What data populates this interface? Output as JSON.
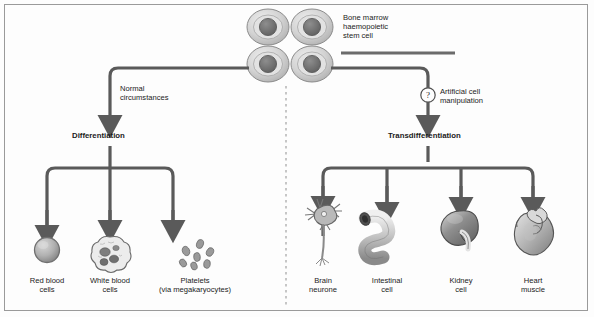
{
  "figure": {
    "source_cell": {
      "label": "Bone marrow\nhaemopoietic\nstem cell",
      "icon": "stem-cell-cluster-icon",
      "count": 4
    },
    "pathways": [
      {
        "id": "normal",
        "condition_label": "Normal\ncircumstances",
        "process_label": "Differentiation",
        "marker_icon": null,
        "outputs": [
          {
            "id": "red-blood-cells",
            "label": "Red blood\ncells",
            "icon": "red-blood-cell-icon"
          },
          {
            "id": "white-blood-cells",
            "label": "White blood\ncells",
            "icon": "white-blood-cell-icon"
          },
          {
            "id": "platelets",
            "label": "Platelets\n(via megakaryocytes)",
            "icon": "platelets-icon"
          }
        ]
      },
      {
        "id": "artificial",
        "condition_label": "Artificial cell\nmanipulation",
        "process_label": "Transdifferentiation",
        "marker_icon": "question-mark-circle-icon",
        "marker_glyph": "?",
        "outputs": [
          {
            "id": "brain-neurone",
            "label": "Brain\nneurone",
            "icon": "neurone-icon"
          },
          {
            "id": "intestinal-cell",
            "label": "Intestinal\ncell",
            "icon": "intestine-icon"
          },
          {
            "id": "kidney-cell",
            "label": "Kidney\ncell",
            "icon": "kidney-icon"
          },
          {
            "id": "heart-muscle",
            "label": "Heart\nmuscle",
            "icon": "heart-icon"
          }
        ]
      }
    ],
    "divider": {
      "name": "pathway-divider",
      "style": "dashed-vertical"
    },
    "colors": {
      "arrow": "#5a5a5a",
      "text": "#1b1b1b",
      "border": "#9a9a9a",
      "background": "#fdfdfd",
      "cell_fill": "#bdbdbd",
      "nucleus": "#6e6e6e"
    }
  }
}
